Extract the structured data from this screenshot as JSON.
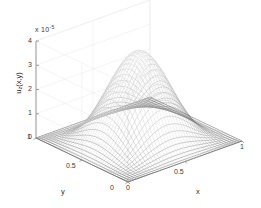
{
  "figure": {
    "kind": "matlab-mesh-surface-plot",
    "background_color": "#ffffff",
    "mesh_color_dark": "#4a4a4a",
    "mesh_color_light": "#d8d8d8",
    "axis_color": "#8a8a8a",
    "grid_color": "#ededed",
    "text_color": "#2b2b2b"
  },
  "axes": {
    "z": {
      "label": "u",
      "label_sub": "z",
      "label_tail": "(x,y)",
      "label_full": "u_z(x,y)",
      "exponent_prefix": "x 10",
      "exponent_value": "-5",
      "exponent_full": "x 10^-5",
      "ticks": [
        "0",
        "1",
        "2",
        "3",
        "4"
      ],
      "tick_values": [
        0,
        1,
        2,
        3,
        4
      ],
      "range": [
        0,
        4
      ]
    },
    "x": {
      "label": "x",
      "ticks": [
        "0",
        "0.5",
        "1"
      ],
      "tick_values": [
        0,
        0.5,
        1
      ],
      "range": [
        0,
        1
      ]
    },
    "y": {
      "label": "y",
      "ticks": [
        "0",
        "0.5",
        "1"
      ],
      "tick_values": [
        0,
        0.5,
        1
      ],
      "range": [
        0,
        1
      ]
    }
  },
  "chart_data": {
    "type": "surface",
    "title": "",
    "subtitle": "",
    "xlabel": "x",
    "ylabel": "y",
    "zlabel": "u_z(x,y)",
    "z_exponent": -5,
    "z_scale_text": "x 10^-5",
    "xlim": [
      0,
      1
    ],
    "ylim": [
      0,
      1
    ],
    "zlim": [
      0,
      4
    ],
    "xticks": [
      0,
      0.5,
      1
    ],
    "yticks": [
      0,
      0.5,
      1
    ],
    "zticks": [
      0,
      1,
      2,
      3,
      4
    ],
    "grid": true,
    "legend": "none",
    "colormap": "gray",
    "render_style": "mesh",
    "grid_n": 41,
    "peak_value": 3.65,
    "peak_x": 0.5,
    "peak_y": 0.5,
    "boundary_value": 0,
    "surface_formula": "z = 3.65 * (sin(pi*x)*sin(pi*y))^2.2",
    "samples": {
      "x": [
        0,
        0.125,
        0.25,
        0.375,
        0.5,
        0.625,
        0.75,
        0.875,
        1
      ],
      "y": [
        0,
        0.125,
        0.25,
        0.375,
        0.5,
        0.625,
        0.75,
        0.875,
        1
      ],
      "z": [
        [
          0,
          0,
          0,
          0,
          0,
          0,
          0,
          0,
          0
        ],
        [
          0,
          0.13,
          0.36,
          0.56,
          0.63,
          0.56,
          0.36,
          0.13,
          0
        ],
        [
          0,
          0.36,
          1.02,
          1.58,
          1.79,
          1.58,
          1.02,
          0.36,
          0
        ],
        [
          0,
          0.56,
          1.58,
          2.45,
          2.77,
          2.45,
          1.58,
          0.56,
          0
        ],
        [
          0,
          0.63,
          1.79,
          2.77,
          3.65,
          2.77,
          1.79,
          0.63,
          0
        ],
        [
          0,
          0.56,
          1.58,
          2.45,
          2.77,
          2.45,
          1.58,
          0.56,
          0
        ],
        [
          0,
          0.36,
          1.02,
          1.58,
          1.79,
          1.58,
          1.02,
          0.36,
          0
        ],
        [
          0,
          0.13,
          0.36,
          0.56,
          0.63,
          0.56,
          0.36,
          0.13,
          0
        ],
        [
          0,
          0,
          0,
          0,
          0,
          0,
          0,
          0,
          0
        ]
      ]
    }
  }
}
